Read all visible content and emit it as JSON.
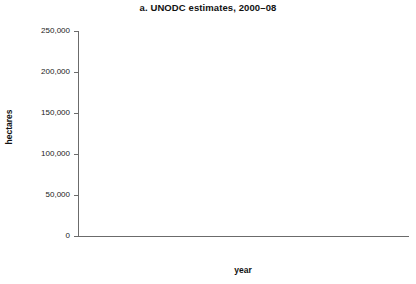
{
  "chart_data": {
    "type": "bar",
    "subtype": "stacked-bar",
    "title": "a. UNODC estimates, 2000–08",
    "xlabel": "year",
    "ylabel": "hectares",
    "categories": [
      "2000",
      "2001",
      "2002",
      "2003",
      "2004",
      "2005",
      "2006",
      "2007",
      "2008"
    ],
    "x_tick_labels": [
      "2000",
      "",
      "2002",
      "",
      "2004",
      "",
      "2006",
      "",
      "2008"
    ],
    "y_tick_labels": [
      "0",
      "50,000",
      "100,000",
      "150,000",
      "200,000",
      "250,000"
    ],
    "y_tick_values": [
      0,
      50000,
      100000,
      150000,
      200000,
      250000
    ],
    "ylim": [
      0,
      250000
    ],
    "grid": false,
    "legend": "none",
    "series": [
      {
        "name": "bottom-segment",
        "color": "#121212",
        "values": [
          16000,
          22000,
          23000,
          25000,
          29000,
          28000,
          29000,
          31000,
          32000
        ]
      },
      {
        "name": "middle-segment",
        "color": "#585858",
        "values": [
          162000,
          144000,
          102000,
          87000,
          80000,
          85000,
          78000,
          99000,
          81000
        ]
      },
      {
        "name": "top-segment",
        "color": "#a9a9a9",
        "values": [
          44000,
          46000,
          47000,
          43000,
          51000,
          48000,
          52000,
          54000,
          56000
        ]
      }
    ],
    "cumulative_tops": {
      "bottom": [
        16000,
        22000,
        23000,
        25000,
        29000,
        28000,
        29000,
        31000,
        32000
      ],
      "middle": [
        178000,
        166000,
        125000,
        112000,
        109000,
        113000,
        107000,
        130000,
        113000
      ],
      "total": [
        222000,
        212000,
        172000,
        155000,
        160000,
        161000,
        159000,
        184000,
        169000
      ]
    }
  },
  "colors": {
    "segment_bottom": "#121212",
    "segment_middle": "#585858",
    "segment_top": "#a9a9a9",
    "axis": "#6b6b6b",
    "background": "#ffffff",
    "text": "#1a1a1a"
  }
}
